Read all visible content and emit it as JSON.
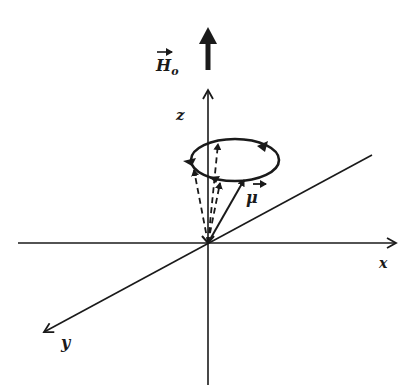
{
  "figure": {
    "labels": {
      "field": "H",
      "field_subscript": "o",
      "z_axis": "z",
      "x_axis": "x",
      "y_axis": "y",
      "moment": "μ"
    },
    "colors": {
      "ink": "#1a1a1a",
      "background": "#ffffff"
    },
    "elements": {
      "field_vector": "H₀ static magnetic field (thick arrow along +z)",
      "precession_cone": "magnetic moment μ precessing about z-axis",
      "axes": [
        "x",
        "y",
        "z"
      ]
    }
  }
}
